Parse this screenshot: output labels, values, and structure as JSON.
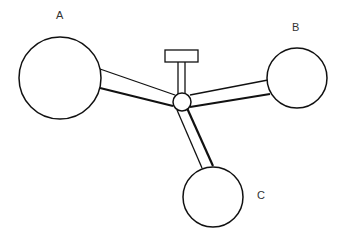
{
  "diagram": {
    "type": "hub-and-spoke mechanical linkage",
    "stroke_color": "#111111",
    "background": "#ffffff",
    "nodes": [
      {
        "id": "A",
        "label": "A",
        "cx": 60,
        "cy": 78,
        "r": 41
      },
      {
        "id": "B",
        "label": "B",
        "cx": 297,
        "cy": 78,
        "r": 30
      },
      {
        "id": "C",
        "label": "C",
        "cx": 213,
        "cy": 197,
        "r": 30
      }
    ],
    "hub": {
      "cx": 182,
      "cy": 102,
      "r": 9
    },
    "top_block": {
      "x": 165,
      "y": 50,
      "w": 33,
      "h": 12
    },
    "labels": {
      "A": "A",
      "B": "B",
      "C": "C"
    }
  }
}
